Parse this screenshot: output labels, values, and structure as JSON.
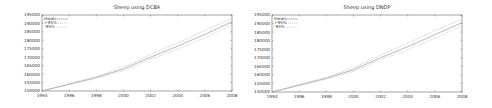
{
  "chart_data": [
    {
      "type": "line",
      "title": "Sheep using DCBA",
      "xlabel": "",
      "ylabel": "",
      "xlim": [
        1994,
        2008
      ],
      "ylim": [
        150000,
        195000
      ],
      "xticks": [
        "1994",
        "1996",
        "1998",
        "2000",
        "2002",
        "2004",
        "2006",
        "2008"
      ],
      "yticks": [
        "150000",
        "155000",
        "160000",
        "165000",
        "170000",
        "175000",
        "180000",
        "185000",
        "190000",
        "195000"
      ],
      "legend_position": "upper left",
      "x": [
        1994,
        1996,
        1998,
        2000,
        2002,
        2004,
        2006,
        2008
      ],
      "series": [
        {
          "name": "mean",
          "values": [
            150000,
            154000,
            158000,
            163000,
            170000,
            176500,
            183500,
            191000
          ]
        },
        {
          "name": "+95%",
          "values": [
            150000,
            154300,
            158600,
            164000,
            171500,
            178500,
            185800,
            193000
          ]
        },
        {
          "name": "-95%",
          "values": [
            150000,
            153700,
            157500,
            162000,
            168800,
            174800,
            181500,
            189000
          ]
        }
      ]
    },
    {
      "type": "line",
      "title": "Sheep using DNDP",
      "xlabel": "",
      "ylabel": "",
      "xlim": [
        1994,
        2008
      ],
      "ylim": [
        150000,
        195000
      ],
      "xticks": [
        "1994",
        "1996",
        "1998",
        "2000",
        "2002",
        "2004",
        "2006",
        "2008"
      ],
      "yticks": [
        "150000",
        "155000",
        "160000",
        "165000",
        "170000",
        "175000",
        "180000",
        "185000",
        "190000",
        "195000"
      ],
      "legend_position": "upper left",
      "x": [
        1994,
        1996,
        1998,
        2000,
        2002,
        2004,
        2006,
        2008
      ],
      "series": [
        {
          "name": "mean",
          "values": [
            150000,
            154000,
            158000,
            163000,
            170000,
            176500,
            183500,
            190500
          ]
        },
        {
          "name": "+95%",
          "values": [
            150000,
            154300,
            158600,
            164000,
            171500,
            178500,
            185800,
            192500
          ]
        },
        {
          "name": "-95%",
          "values": [
            150000,
            153700,
            157500,
            162000,
            168800,
            174800,
            181500,
            188500
          ]
        }
      ]
    }
  ],
  "charts": [
    {
      "title": "Sheep using DCBA",
      "legend": [
        "mean",
        "+95%",
        "-95%"
      ]
    },
    {
      "title": "Sheep using DNDP",
      "legend": [
        "mean",
        "+95%",
        "-95%"
      ]
    }
  ],
  "colors": {
    "axis": "#666666",
    "mean": "#8a8a8a",
    "upper": "#b0b0b0",
    "lower": "#b0b0b0"
  }
}
